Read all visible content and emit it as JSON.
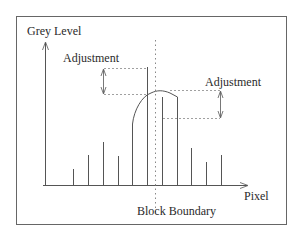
{
  "diagram": {
    "y_axis_label": "Grey Level",
    "x_axis_label": "Pixel",
    "boundary_label": "Block Boundary",
    "left_adjustment_label": "Adjustment",
    "right_adjustment_label": "Adjustment",
    "colors": {
      "line": "#555555",
      "text": "#2a2a2a",
      "frame": "#666666",
      "background": "#ffffff"
    },
    "bars_left_of_boundary": [
      {
        "x": 73,
        "top": 169
      },
      {
        "x": 88,
        "top": 155
      },
      {
        "x": 103,
        "top": 142
      },
      {
        "x": 118,
        "top": 156
      },
      {
        "x": 132,
        "top": 124
      },
      {
        "x": 147,
        "top": 67
      }
    ],
    "bars_right_of_boundary": [
      {
        "x": 162,
        "top": 97
      },
      {
        "x": 177,
        "top": 97
      },
      {
        "x": 191,
        "top": 148
      },
      {
        "x": 206,
        "top": 162
      },
      {
        "x": 221,
        "top": 155
      }
    ]
  }
}
